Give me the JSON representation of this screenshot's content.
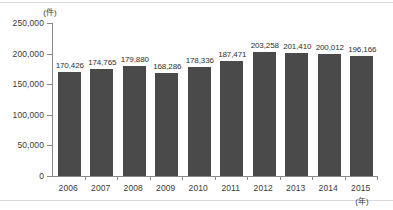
{
  "chart_data": {
    "type": "bar",
    "title": "",
    "subtitle": "",
    "xlabel": "(年)",
    "ylabel": "(件)",
    "categories": [
      "2006",
      "2007",
      "2008",
      "2009",
      "2010",
      "2011",
      "2012",
      "2013",
      "2014",
      "2015"
    ],
    "values": [
      170426,
      174765,
      179880,
      168286,
      178336,
      187471,
      203258,
      201410,
      200012,
      196166
    ],
    "value_labels": [
      "170,426",
      "174,765",
      "179,880",
      "168,286",
      "178,336",
      "187,471",
      "203,258",
      "201,410",
      "200,012",
      "196,166"
    ],
    "ylim": [
      0,
      250000
    ],
    "y_ticks": [
      0,
      50000,
      100000,
      150000,
      200000,
      250000
    ],
    "y_tick_labels": [
      "0",
      "50,000",
      "100,000",
      "150,000",
      "200,000",
      "250,000"
    ],
    "grid": false,
    "legend": null,
    "bar_color": "#4a4a4a",
    "axis_color": "#8a8a8a",
    "text_color": "#3a3a3a"
  }
}
